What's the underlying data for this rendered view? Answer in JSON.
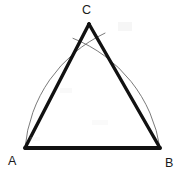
{
  "figure": {
    "background_color": "#ffffff",
    "stroke_color": "#111111",
    "arc_color": "#6b6b6b",
    "label_color": "#1a1a1a",
    "width": 181,
    "height": 173
  },
  "labels": {
    "apex": "C",
    "bottom_left": "A",
    "bottom_right": "B"
  },
  "chart_data": {
    "type": "scatter",
    "xlabel": "",
    "ylabel": "",
    "xlim": [
      0,
      181
    ],
    "ylim": [
      0,
      173
    ],
    "grid": false,
    "legend": "none",
    "points": [
      {
        "name": "A",
        "label": "A",
        "x": 25,
        "y": 148
      },
      {
        "name": "B",
        "label": "B",
        "x": 160,
        "y": 148
      },
      {
        "name": "C",
        "label": "C",
        "x": 89,
        "y": 24
      },
      {
        "name": "arc-intersection",
        "label": "",
        "x": 89,
        "y": 21
      }
    ],
    "segments": [
      {
        "name": "side-AB",
        "from": "A",
        "to": "B",
        "x1": 25,
        "y1": 148,
        "x2": 160,
        "y2": 148,
        "width": 4.2,
        "color": "#111111"
      },
      {
        "name": "side-AC",
        "from": "A",
        "to": "C",
        "x1": 25,
        "y1": 148,
        "x2": 89,
        "y2": 24,
        "width": 3.4,
        "color": "#111111"
      },
      {
        "name": "side-BC",
        "from": "B",
        "to": "C",
        "x1": 160,
        "y1": 148,
        "x2": 89,
        "y2": 24,
        "width": 3.4,
        "color": "#111111"
      }
    ],
    "arcs": [
      {
        "name": "arc-centered-at-A",
        "center": "A",
        "cx": 25,
        "cy": 148,
        "radius": 140,
        "width": 0.9,
        "color": "#6b6b6b"
      },
      {
        "name": "arc-centered-at-B",
        "center": "B",
        "cx": 160,
        "cy": 148,
        "radius": 140,
        "width": 0.9,
        "color": "#6b6b6b"
      }
    ],
    "annotations": [
      {
        "name": "label-C",
        "text": "C",
        "x": 89,
        "y": 10,
        "anchor": "center"
      },
      {
        "name": "label-A",
        "text": "A",
        "x": 13,
        "y": 161,
        "anchor": "center"
      },
      {
        "name": "label-B",
        "text": "B",
        "x": 170,
        "y": 163,
        "anchor": "center"
      }
    ],
    "side_length": 140,
    "measured_angles": [
      60,
      60,
      60
    ]
  }
}
